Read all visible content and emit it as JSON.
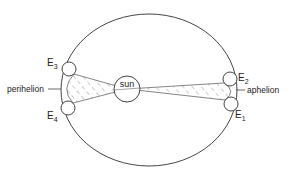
{
  "diagram": {
    "type": "kepler-second-law",
    "labels": {
      "sun": "sun",
      "perihelion": "perihelion",
      "aphelion": "aphelion",
      "E1": {
        "base": "E",
        "sub": "1"
      },
      "E2": {
        "base": "E",
        "sub": "2"
      },
      "E3": {
        "base": "E",
        "sub": "3"
      },
      "E4": {
        "base": "E",
        "sub": "4"
      }
    },
    "colors": {
      "stroke": "#444444",
      "hatch": "#777777",
      "text": "#222222"
    }
  }
}
